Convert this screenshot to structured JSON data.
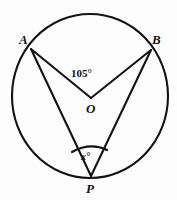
{
  "figure": {
    "background_color": "#fdfdfd",
    "stroke_color": "#131313"
  },
  "circle": {
    "center_x": 90,
    "center_y": 96,
    "radius": 78,
    "stroke_width": 2
  },
  "points": {
    "A": {
      "label": "A",
      "x": 31,
      "y": 49
    },
    "B": {
      "label": "B",
      "x": 151,
      "y": 50
    },
    "O": {
      "label": "O",
      "x": 91,
      "y": 98
    },
    "P": {
      "label": "P",
      "x": 91,
      "y": 176
    }
  },
  "segments": [
    {
      "name": "segment-AO",
      "from": "A",
      "to": "O"
    },
    {
      "name": "segment-BO",
      "from": "B",
      "to": "O"
    },
    {
      "name": "segment-AP",
      "from": "A",
      "to": "P"
    },
    {
      "name": "segment-BP",
      "from": "B",
      "to": "P"
    }
  ],
  "angles": {
    "central": {
      "name": "angle-AOB",
      "label": "105°",
      "value": 105,
      "unit": "degrees",
      "vertex": "O"
    },
    "inscribed": {
      "name": "angle-APB",
      "label": "x°",
      "value": "x",
      "unit": "degrees",
      "vertex": "P",
      "arc_marker": true
    }
  }
}
